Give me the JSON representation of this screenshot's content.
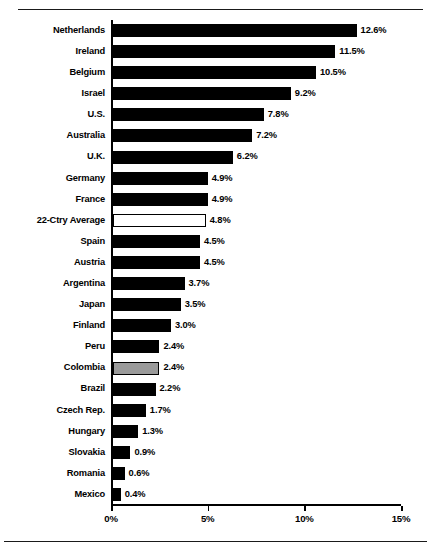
{
  "chart_data": {
    "type": "bar",
    "orientation": "horizontal",
    "title": "",
    "xlabel": "",
    "ylabel": "",
    "xlim": [
      0,
      15
    ],
    "xticks": [
      "0%",
      "5%",
      "10%",
      "15%"
    ],
    "xtick_values": [
      0,
      5,
      10,
      15
    ],
    "grid": false,
    "legend": "none",
    "categories": [
      "Netherlands",
      "Ireland",
      "Belgium",
      "Israel",
      "U.S.",
      "Australia",
      "U.K.",
      "Germany",
      "France",
      "22-Ctry Average",
      "Spain",
      "Austria",
      "Argentina",
      "Japan",
      "Finland",
      "Peru",
      "Colombia",
      "Brazil",
      "Czech Rep.",
      "Hungary",
      "Slovakia",
      "Romania",
      "Mexico"
    ],
    "values": [
      12.6,
      11.5,
      10.5,
      9.2,
      7.8,
      7.2,
      6.2,
      4.9,
      4.9,
      4.8,
      4.5,
      4.5,
      3.7,
      3.5,
      3.0,
      2.4,
      2.4,
      2.2,
      1.7,
      1.3,
      0.9,
      0.6,
      0.4
    ],
    "data_labels": [
      "12.6%",
      "11.5%",
      "10.5%",
      "9.2%",
      "7.8%",
      "7.2%",
      "6.2%",
      "4.9%",
      "4.9%",
      "4.8%",
      "4.5%",
      "4.5%",
      "3.7%",
      "3.5%",
      "3.0%",
      "2.4%",
      "2.4%",
      "2.2%",
      "1.7%",
      "1.3%",
      "0.9%",
      "0.6%",
      "0.4%"
    ],
    "bar_styles": [
      "black",
      "black",
      "black",
      "black",
      "black",
      "black",
      "black",
      "black",
      "black",
      "white",
      "black",
      "black",
      "black",
      "black",
      "black",
      "black",
      "gray",
      "black",
      "black",
      "black",
      "black",
      "black",
      "black"
    ],
    "colors": {
      "black": "#000000",
      "white": "#ffffff",
      "gray": "#9a9a9a",
      "axis": "#000000",
      "background": "#ffffff"
    }
  },
  "caption": {
    "text": ""
  }
}
